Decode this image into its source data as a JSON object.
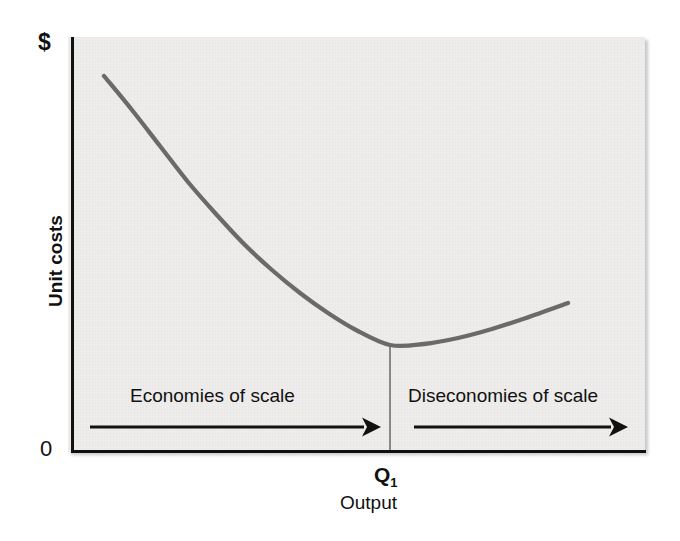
{
  "chart_data": {
    "type": "line",
    "title": "",
    "subtitle": "",
    "xlabel": "Output",
    "ylabel": "Unit costs",
    "y_axis_top_label": "$",
    "y_axis_origin_label": "0",
    "grid": false,
    "legend": null,
    "xlim": [
      0,
      100
    ],
    "ylim": [
      0,
      100
    ],
    "series": [
      {
        "name": "Long-run average cost (LRAC)",
        "color": "#6a6a6a",
        "linewidth": 4,
        "x": [
          6,
          12,
          18,
          24,
          30,
          36,
          42,
          48,
          55,
          62,
          70,
          78,
          86,
          94,
          100
        ],
        "y": [
          92,
          82,
          72,
          63,
          54,
          46,
          39,
          33,
          27,
          23,
          20,
          19,
          21,
          25,
          30
        ],
        "points_px": [
          [
            104,
            76
          ],
          [
            132,
            110
          ],
          [
            160,
            146
          ],
          [
            188,
            182
          ],
          [
            216,
            214
          ],
          [
            244,
            244
          ],
          [
            272,
            270
          ],
          [
            300,
            293
          ],
          [
            328,
            313
          ],
          [
            356,
            330
          ],
          [
            390,
            345
          ],
          [
            424,
            344
          ],
          [
            458,
            338
          ],
          [
            492,
            329
          ],
          [
            526,
            318
          ],
          [
            568,
            303
          ]
        ]
      }
    ],
    "annotations": [
      {
        "name": "economies-of-scale",
        "text": "Economies of scale",
        "arrow": "right",
        "region": "left-of-Q1"
      },
      {
        "name": "diseconomies-of-scale",
        "text": "Diseconomies of scale",
        "arrow": "right",
        "region": "right-of-Q1"
      },
      {
        "name": "q1-marker",
        "text": "Q",
        "subscript": "1",
        "type": "vertical-dropline",
        "x_value": 70,
        "note": "minimum point of the average cost curve"
      }
    ],
    "colors": {
      "curve": "#6a6a6a",
      "axis": "#111111",
      "panel_background": "#eeedec",
      "arrow": "#111111",
      "dropline": "#6f6f6f",
      "text": "#111111"
    }
  },
  "labels": {
    "dollar": "$",
    "zero": "0",
    "y_axis": "Unit costs",
    "economies": "Economies of scale",
    "diseconomies": "Diseconomies of scale",
    "q1_base": "Q",
    "q1_sub": "1",
    "output": "Output"
  }
}
